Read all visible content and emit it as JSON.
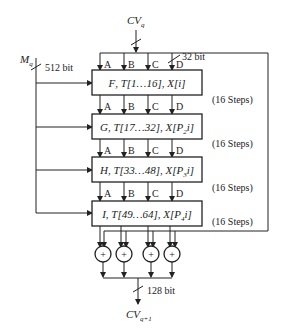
{
  "diagram": {
    "input_chain": {
      "label": "CV",
      "subscript": "q"
    },
    "input_message": {
      "label": "M",
      "subscript": "q",
      "width_label": "512 bit"
    },
    "register_width_label": "32 bit",
    "registers": [
      "A",
      "B",
      "C",
      "D"
    ],
    "rounds": [
      {
        "func": "F",
        "t_range": "T[1…16]",
        "x_index": "X[i]",
        "x_sub": "",
        "steps": "(16 Steps)"
      },
      {
        "func": "G",
        "t_range": "T[17…32]",
        "x_index": "X[P",
        "x_sub": "2",
        "x_tail": "i]",
        "steps": "(16 Steps)"
      },
      {
        "func": "H",
        "t_range": "T[33…48]",
        "x_index": "X[P",
        "x_sub": "3",
        "x_tail": "i]",
        "steps": "(16 Steps)"
      },
      {
        "func": "I",
        "t_range": "T[49…64]",
        "x_index": "X[P",
        "x_sub": "4",
        "x_tail": "i]",
        "steps": "(16 Steps)"
      }
    ],
    "adder_symbol": "+",
    "adders_count": 4,
    "output_width_label": "128 bit",
    "output_chain": {
      "label": "CV",
      "subscript": "q+1"
    }
  }
}
